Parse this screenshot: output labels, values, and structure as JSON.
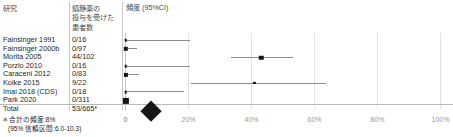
{
  "headers": {
    "study": "研究",
    "count_lines": [
      "鎮静薬の",
      "投与を受けた",
      "患者数"
    ],
    "effect": "頻度 (95%CI)"
  },
  "footnote": {
    "line1": "＊合計の頻度:8%",
    "line2": "(95% 信頼区間:6.0-10.3)"
  },
  "total": {
    "label": "Total",
    "count": "53/665*"
  },
  "chart_data": {
    "type": "forest",
    "title": "",
    "xlabel": "",
    "ylabel": "",
    "xlim": [
      0,
      100
    ],
    "xticks": [
      0,
      20,
      40,
      60,
      80,
      100
    ],
    "xtick_labels": [
      "0",
      "20%",
      "40%",
      "60%",
      "80%",
      "100%"
    ],
    "grid": true,
    "legend": "none",
    "columns": [
      "研究",
      "鎮静薬の投与を受けた患者数",
      "頻度 (95%CI)"
    ],
    "rows": [
      {
        "study": "Fainsinger 1991",
        "count": "0/16",
        "events": 0,
        "n": 16,
        "estimate": 0.0,
        "ci_low": 0.0,
        "ci_high": 20.6,
        "weight": 2.4
      },
      {
        "study": "Fainsinger 2000b",
        "count": "0/97",
        "events": 0,
        "n": 97,
        "estimate": 0.0,
        "ci_low": 0.0,
        "ci_high": 3.7,
        "weight": 4.2
      },
      {
        "study": "Morita 2005",
        "count": "44/102",
        "events": 44,
        "n": 102,
        "estimate": 43.1,
        "ci_low": 33.4,
        "ci_high": 53.3,
        "weight": 4.3
      },
      {
        "study": "Porzio 2010",
        "count": "0/16",
        "events": 0,
        "n": 16,
        "estimate": 0.0,
        "ci_low": 0.0,
        "ci_high": 20.6,
        "weight": 2.4
      },
      {
        "study": "Caraceni 2012",
        "count": "0/83",
        "events": 0,
        "n": 83,
        "estimate": 0.0,
        "ci_low": 0.0,
        "ci_high": 4.3,
        "weight": 4.0
      },
      {
        "study": "Koike 2015",
        "count": "9/22",
        "events": 9,
        "n": 22,
        "estimate": 40.9,
        "ci_low": 20.7,
        "ci_high": 63.6,
        "weight": 1.5
      },
      {
        "study": "Imai 2018 (CDS)",
        "count": "0/18",
        "events": 0,
        "n": 18,
        "estimate": 0.0,
        "ci_low": 0.0,
        "ci_high": 18.5,
        "weight": 2.5
      },
      {
        "study": "Park 2020",
        "count": "0/311",
        "events": 0,
        "n": 311,
        "estimate": 0.0,
        "ci_low": 0.0,
        "ci_high": 1.2,
        "weight": 6.0
      }
    ],
    "summary": {
      "label": "Total",
      "count": "53/665*",
      "estimate": 8.0,
      "ci_low": 6.0,
      "ci_high": 10.3
    }
  }
}
